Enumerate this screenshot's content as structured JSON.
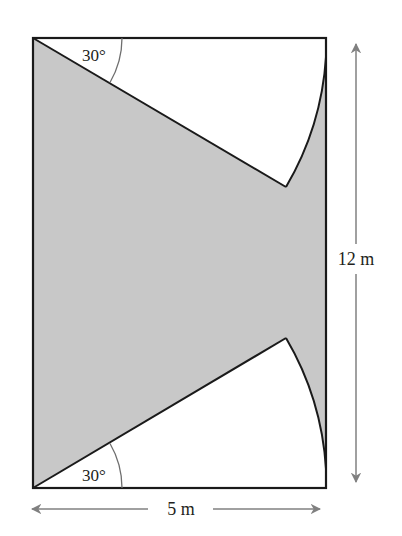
{
  "figure": {
    "type": "geometry-diagram",
    "colors": {
      "background": "#ffffff",
      "shaded_region": "#c8c8c8",
      "outline": "#1a1a1a",
      "dimension_arrows": "#808080",
      "angle_arc": "#6e6e6e",
      "text": "#231f20"
    },
    "rectangle": {
      "width_label": "5 m",
      "height_label": "12 m"
    },
    "sectors": [
      {
        "position": "top-left corner",
        "angle_label": "30°"
      },
      {
        "position": "bottom-left corner",
        "angle_label": "30°"
      }
    ]
  },
  "labels": {
    "top_angle": "30°",
    "bottom_angle": "30°",
    "width": "5 m",
    "height": "12 m"
  }
}
